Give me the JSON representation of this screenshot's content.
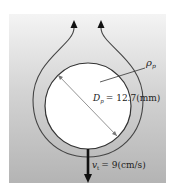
{
  "diagram": {
    "density_label": "ρ",
    "density_sub": "p",
    "diameter_label": "D",
    "diameter_sub": "p",
    "diameter_value": "= 12.7(mm)",
    "velocity_label": "v",
    "velocity_sub": "t",
    "velocity_value": "= 9(cm/s)"
  },
  "colors": {
    "background_shade": "#b8b8b8",
    "particle_fill": "#ffffff",
    "stroke": "#333333"
  }
}
